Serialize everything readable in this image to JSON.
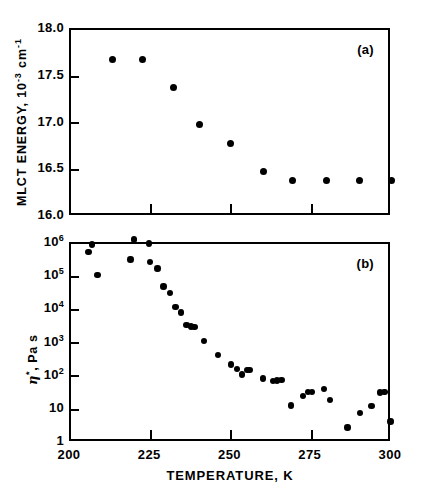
{
  "figure": {
    "xaxis": {
      "title": "TEMPERATURE, K",
      "ticks": [
        "200",
        "225",
        "250",
        "275",
        "300"
      ],
      "min": 200,
      "max": 300
    }
  },
  "chart_data": [
    {
      "type": "scatter",
      "panel": "a",
      "panel_label": "(a)",
      "title": "",
      "xlabel": "TEMPERATURE, K",
      "ylabel": "MLCT ENERGY, 10⁻³ cm⁻¹",
      "ylabel_parts": {
        "text": "MLCT ENERGY, 10",
        "exp1": "-3",
        "mid": " cm",
        "exp2": "-1"
      },
      "xlim": [
        200,
        300
      ],
      "ylim": [
        16.0,
        18.0
      ],
      "yscale": "linear",
      "xticks": [
        200,
        225,
        250,
        275,
        300
      ],
      "yticks": [
        16.0,
        16.5,
        17.0,
        17.5,
        18.0
      ],
      "ytick_labels": [
        "16.0",
        "16.5",
        "17.0",
        "17.5",
        "18.0"
      ],
      "grid": false,
      "legend": false,
      "marker": "filled-circle",
      "marker_color": "#000000",
      "x": [
        212.8,
        222.2,
        231.9,
        240.0,
        249.8,
        260.0,
        268.9,
        279.6,
        290.0,
        299.8
      ],
      "y": [
        17.68,
        17.68,
        17.39,
        16.99,
        16.79,
        16.49,
        16.39,
        16.39,
        16.39,
        16.39
      ]
    },
    {
      "type": "scatter",
      "panel": "b",
      "panel_label": "(b)",
      "title": "",
      "xlabel": "TEMPERATURE, K",
      "ylabel": "η*, Pa s",
      "xlim": [
        200,
        300
      ],
      "ylim": [
        1,
        1000000
      ],
      "yscale": "log",
      "xticks": [
        200,
        225,
        250,
        275,
        300
      ],
      "yticks": [
        1,
        10,
        100,
        1000,
        10000,
        100000,
        1000000
      ],
      "ytick_labels": [
        "1",
        "10",
        "10²",
        "10³",
        "10⁴",
        "10⁵",
        "10⁶"
      ],
      "grid": false,
      "legend": false,
      "marker": "filled-circle",
      "marker_color": "#000000",
      "x": [
        205.4,
        206.5,
        208.3,
        219.6,
        218.5,
        224.3,
        224.6,
        226.9,
        228.8,
        230.8,
        232.6,
        234.2,
        236.0,
        237.4,
        238.4,
        241.4,
        245.8,
        249.8,
        251.7,
        253.2,
        254.8,
        255.6,
        259.8,
        263.0,
        264.2,
        265.6,
        268.5,
        272.2,
        273.9,
        275.1,
        278.8,
        280.7,
        286.1,
        290.0,
        293.6,
        296.2,
        297.6,
        299.6
      ],
      "y": [
        580000.0,
        950000.0,
        115000.0,
        1350000.0,
        340000.0,
        1050000.0,
        290000.0,
        180000.0,
        53000.0,
        33000.0,
        12500.0,
        8500.0,
        3600.0,
        3300.0,
        3100.0,
        1200.0,
        450.0,
        230.0,
        170.0,
        115.0,
        160.0,
        160.0,
        88.0,
        75.0,
        76.0,
        80.0,
        13.5,
        26.0,
        34.0,
        34.0,
        42.0,
        19.5,
        2.9,
        8.0,
        13.0,
        33.0,
        34.0,
        4.5
      ]
    }
  ]
}
